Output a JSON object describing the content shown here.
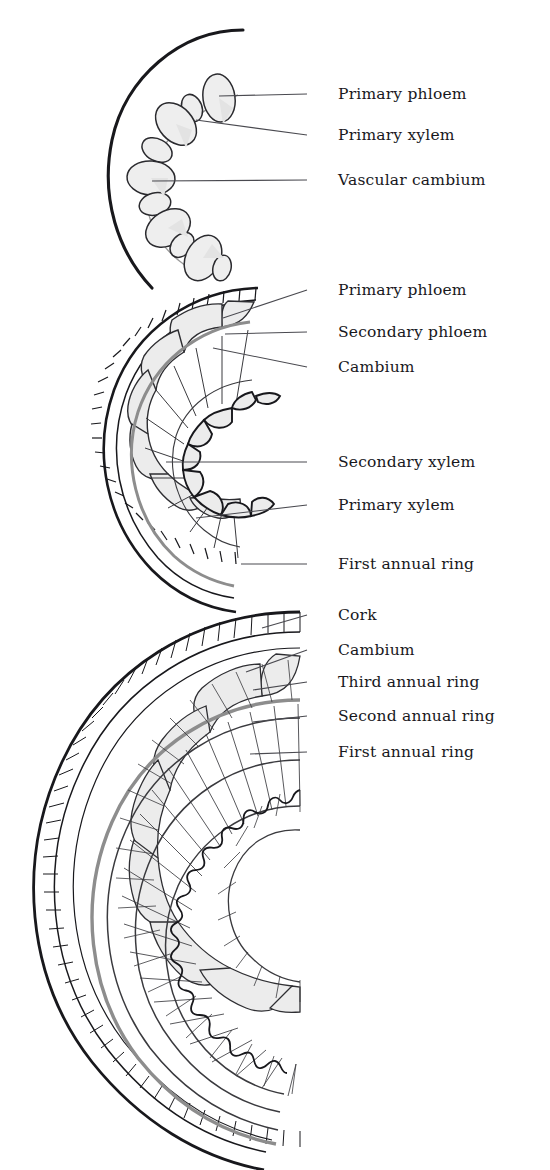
{
  "figure": {
    "kind": "botanical-diagram",
    "background_color": "#ffffff",
    "ink_color": "#18181c",
    "cambium_color": "#8d8d8d",
    "cell_fill_color": "#ececec",
    "leader_color": "#4a4a50"
  },
  "labels": [
    {
      "id": "l1",
      "text": "Primary phloem",
      "x": 338,
      "y": 85,
      "leader": {
        "x1": 307,
        "y1": 94,
        "x2": 219,
        "y2": 96
      }
    },
    {
      "id": "l2",
      "text": "Primary xylem",
      "x": 338,
      "y": 126,
      "leader": {
        "x1": 307,
        "y1": 135,
        "x2": 196,
        "y2": 120
      }
    },
    {
      "id": "l3",
      "text": "Vascular cambium",
      "x": 338,
      "y": 171,
      "leader": {
        "x1": 307,
        "y1": 180,
        "x2": 152,
        "y2": 181
      }
    },
    {
      "id": "l4",
      "text": "Primary phloem",
      "x": 338,
      "y": 281,
      "leader": {
        "x1": 307,
        "y1": 290,
        "x2": 223,
        "y2": 318
      }
    },
    {
      "id": "l5",
      "text": "Secondary phloem",
      "x": 338,
      "y": 323,
      "leader": {
        "x1": 307,
        "y1": 332,
        "x2": 225,
        "y2": 334
      }
    },
    {
      "id": "l6",
      "text": "Cambium",
      "x": 338,
      "y": 358,
      "leader": {
        "x1": 307,
        "y1": 367,
        "x2": 213,
        "y2": 348
      }
    },
    {
      "id": "l7",
      "text": "Secondary xylem",
      "x": 338,
      "y": 453,
      "leader": {
        "x1": 307,
        "y1": 462,
        "x2": 166,
        "y2": 462
      }
    },
    {
      "id": "l8",
      "text": "Primary xylem",
      "x": 338,
      "y": 496,
      "leader": {
        "x1": 307,
        "y1": 505,
        "x2": 196,
        "y2": 518
      }
    },
    {
      "id": "l9",
      "text": "First annual ring",
      "x": 338,
      "y": 555,
      "leader": {
        "x1": 307,
        "y1": 564,
        "x2": 241,
        "y2": 564
      }
    },
    {
      "id": "l10",
      "text": "Cork",
      "x": 338,
      "y": 606,
      "leader": {
        "x1": 307,
        "y1": 615,
        "x2": 262,
        "y2": 628
      }
    },
    {
      "id": "l11",
      "text": "Cambium",
      "x": 338,
      "y": 641,
      "leader": {
        "x1": 307,
        "y1": 650,
        "x2": 246,
        "y2": 672
      }
    },
    {
      "id": "l12",
      "text": "Third annual ring",
      "x": 338,
      "y": 673,
      "leader": {
        "x1": 307,
        "y1": 682,
        "x2": 253,
        "y2": 690
      }
    },
    {
      "id": "l13",
      "text": "Second annual ring",
      "x": 338,
      "y": 707,
      "leader": {
        "x1": 307,
        "y1": 716,
        "x2": 253,
        "y2": 722
      }
    },
    {
      "id": "l14",
      "text": "First annual ring",
      "x": 338,
      "y": 743,
      "leader": {
        "x1": 307,
        "y1": 752,
        "x2": 250,
        "y2": 754
      }
    }
  ],
  "stages": [
    {
      "name": "primary-growth-stem",
      "caption_labels": [
        "Primary phloem",
        "Primary xylem",
        "Vascular cambium"
      ],
      "epidermis": {
        "center_x": 243,
        "center_y": 172,
        "radius": 142
      },
      "bundle_count": 9
    },
    {
      "name": "first-year-secondary-growth-stem",
      "caption_labels": [
        "Primary phloem",
        "Secondary phloem",
        "Cambium",
        "Secondary xylem",
        "Primary xylem",
        "First annual ring"
      ],
      "center_x": 256,
      "center_y": 455,
      "cork_outer_radius": 172,
      "cork_inner_radius": 160,
      "phloem_radius": 140,
      "cambium_radius": 126,
      "xylem_inner_radius": 60,
      "annual_rings": 1
    },
    {
      "name": "third-year-secondary-growth-stem",
      "caption_labels": [
        "Cork",
        "Cambium",
        "Third annual ring",
        "Second annual ring",
        "First annual ring"
      ],
      "center_x": 300,
      "center_y": 895,
      "cork_outer_radius": 288,
      "cork_inner_radius": 268,
      "phloem_radius": 240,
      "cambium_radius": 222,
      "annual_ring_radii": [
        196,
        152,
        108
      ],
      "pith_radius": 66,
      "annual_rings": 3
    }
  ]
}
